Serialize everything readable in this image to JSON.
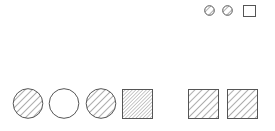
{
  "colors": {
    "stroke": "#555555",
    "hatch": "#777777",
    "background": "#ffffff"
  },
  "top_row": [
    {
      "type": "circle",
      "fill": "hatched"
    },
    {
      "type": "circle",
      "fill": "hatched"
    },
    {
      "type": "square",
      "fill": "empty"
    }
  ],
  "bottom_left_row": [
    {
      "type": "circle",
      "fill": "hatched"
    },
    {
      "type": "circle",
      "fill": "empty"
    },
    {
      "type": "circle",
      "fill": "hatched"
    },
    {
      "type": "square",
      "fill": "dense-hatched"
    }
  ],
  "bottom_right_row": [
    {
      "type": "square",
      "fill": "hatched"
    },
    {
      "type": "square",
      "fill": "hatched"
    }
  ]
}
